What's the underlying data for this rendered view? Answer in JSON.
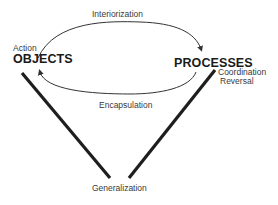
{
  "diagram": {
    "nodes": {
      "objects": "OBJECTS",
      "processes": "PROCESSES"
    },
    "edges": {
      "interiorization": "Interiorization",
      "encapsulation": "Encapsulation",
      "action": "Action",
      "coordination": "Coordination",
      "reversal": "Reversal",
      "generalization": "Generalization"
    },
    "colors": {
      "line": "#1e1e1e",
      "thin_line": "#333333",
      "text": "#333333"
    }
  }
}
